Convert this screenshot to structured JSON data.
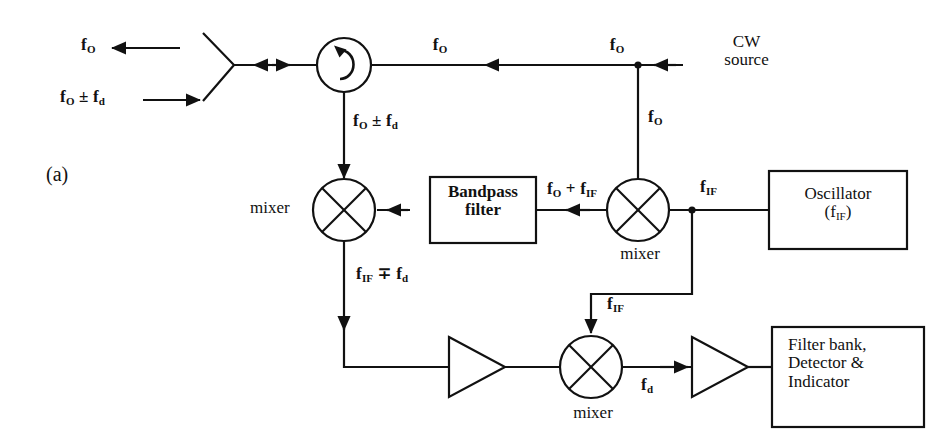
{
  "figure": {
    "panel_label": "(a)",
    "type": "block-diagram"
  },
  "blocks": {
    "cw_source": {
      "line1": "CW",
      "line2": "source"
    },
    "bandpass_filter": {
      "line1": "Bandpass",
      "line2": "filter"
    },
    "oscillator": {
      "line1": "Oscillator",
      "line2_pre": "(f",
      "line2_sub": "IF",
      "line2_post": ")"
    },
    "output_block": {
      "line1": "Filter bank,",
      "line2": "Detector &",
      "line3": "Indicator"
    }
  },
  "component_labels": {
    "mixer_1": "mixer",
    "mixer_2": "mixer",
    "mixer_3": "mixer"
  },
  "signal_labels": {
    "tx_out": {
      "base": "f",
      "sub": "O"
    },
    "rx_in": {
      "base": "f",
      "sub": "O",
      "op": " ± ",
      "base2": "f",
      "sub2": "d"
    },
    "circulator_to_antenna": {
      "base": "f",
      "sub": "O"
    },
    "source_to_circulator": {
      "base": "f",
      "sub": "O"
    },
    "source_branch_down": {
      "base": "f",
      "sub": "O"
    },
    "circulator_down": {
      "base": "f",
      "sub": "O",
      "op": " ± ",
      "base2": "f",
      "sub2": "d"
    },
    "mixer2_out": {
      "base": "f",
      "sub": "O",
      "op": " + ",
      "base2": "f",
      "sub2": "IF"
    },
    "osc_out": {
      "base": "f",
      "sub": "IF"
    },
    "mixer1_out": {
      "base": "f",
      "sub": "IF",
      "op": " ∓ ",
      "base2": "f",
      "sub2": "d"
    },
    "if_to_mixer3": {
      "base": "f",
      "sub": "IF"
    },
    "mixer3_out": {
      "base": "f",
      "sub": "d"
    }
  },
  "icons": {
    "antenna": "horn-antenna-icon",
    "circulator": "circulator-icon",
    "mixer": "mixer-icon",
    "amplifier": "amplifier-triangle-icon",
    "junction": "junction-dot-icon",
    "arrow": "arrowhead-icon"
  },
  "style": {
    "stroke": "#111111",
    "background": "#ffffff",
    "stroke_width": 2.2
  }
}
